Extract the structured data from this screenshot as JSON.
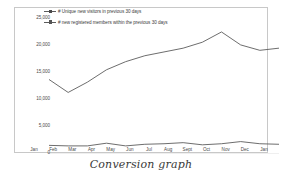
{
  "caption": "Conversion graph",
  "chart_data": {
    "type": "line",
    "title": "",
    "xlabel": "",
    "ylabel": "",
    "ylim": [
      0,
      25000
    ],
    "ytick_step": 5000,
    "ytick_labels": [
      "25,000",
      "20,000",
      "15,000",
      "10,000",
      "5,000",
      "0"
    ],
    "ytick_values": [
      25000,
      20000,
      15000,
      10000,
      5000,
      0
    ],
    "grid": false,
    "legend_position": "top-left",
    "categories": [
      "Jan",
      "Feb",
      "Mar",
      "Apr",
      "May",
      "Jun",
      "Jul",
      "Aug",
      "Sept",
      "Oct",
      "Nov",
      "Dec",
      "Jan"
    ],
    "series": [
      {
        "name": "# Unique new visitors in previous 30 days",
        "color": "#5c5c5c",
        "values": [
          13800,
          11400,
          13300,
          15600,
          17100,
          18200,
          18900,
          19600,
          20700,
          22600,
          20200,
          19200,
          19600
        ]
      },
      {
        "name": "# new registered members within the previous 30 days",
        "color": "#5c5c5c",
        "values": [
          1600,
          1500,
          1500,
          2000,
          1500,
          1800,
          1900,
          2100,
          1700,
          1900,
          2300,
          1900,
          1800
        ]
      }
    ]
  },
  "axis": {
    "y_labels": [
      "25,000",
      "20,000",
      "15,000",
      "10,000",
      "5,000",
      "0"
    ],
    "x_labels": [
      "Jan",
      "Feb",
      "Mar",
      "Apr",
      "May",
      "Jun",
      "Jul",
      "Aug",
      "Sept",
      "Oct",
      "Nov",
      "Dec",
      "Jan"
    ]
  },
  "legend": {
    "items": [
      {
        "label": "# Unique new visitors in previous 30 days"
      },
      {
        "label": "# new registered members within the previous 30 days"
      }
    ]
  }
}
